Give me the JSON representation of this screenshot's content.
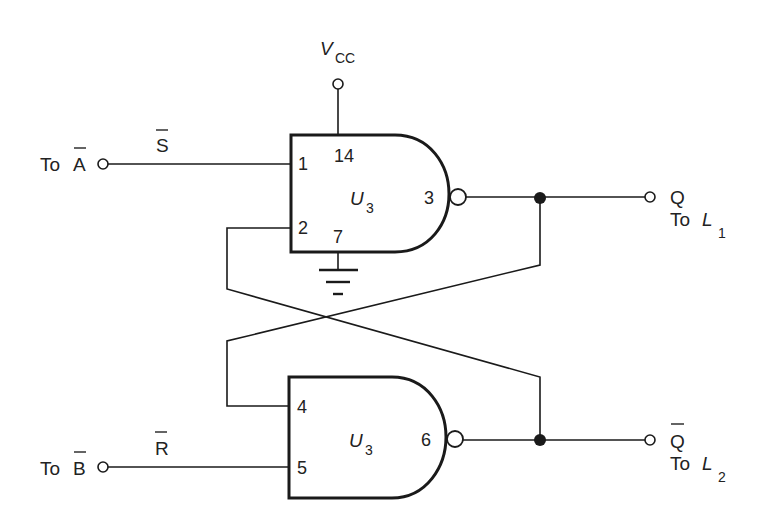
{
  "diagram": {
    "type": "SR latch (cross-coupled NAND gates)",
    "supply": {
      "label": "V",
      "subscript": "CC"
    },
    "inputs": {
      "top": {
        "prefix": "To",
        "signal": "A",
        "inverted": true,
        "line_label": "S",
        "line_label_inverted": true
      },
      "bottom": {
        "prefix": "To",
        "signal": "B",
        "inverted": true,
        "line_label": "R",
        "line_label_inverted": true
      }
    },
    "gates": [
      {
        "id": "upper",
        "name": "U",
        "subscript": "3",
        "pins": {
          "in1": "1",
          "in2": "2",
          "vcc": "14",
          "gnd": "7",
          "out": "3"
        }
      },
      {
        "id": "lower",
        "name": "U",
        "subscript": "3",
        "pins": {
          "in1": "4",
          "in2": "5",
          "out": "6"
        }
      }
    ],
    "outputs": {
      "top": {
        "signal": "Q",
        "inverted": false,
        "dest_prefix": "To",
        "dest": "L",
        "dest_subscript": "1"
      },
      "bottom": {
        "signal": "Q",
        "inverted": true,
        "dest_prefix": "To",
        "dest": "L",
        "dest_subscript": "2"
      }
    }
  }
}
